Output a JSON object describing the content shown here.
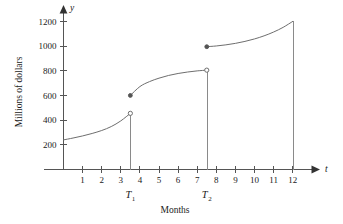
{
  "chart_data": {
    "type": "line",
    "title": "",
    "subtitle": "",
    "xlabel": "Months",
    "ylabel": "Millions of dollars",
    "x_axis_variable": "t",
    "y_axis_variable": "y",
    "xlim": [
      0,
      12.8
    ],
    "ylim": [
      0,
      1260
    ],
    "grid": false,
    "legend": "none",
    "x_ticks": [
      1,
      2,
      3,
      4,
      5,
      6,
      7,
      8,
      9,
      10,
      11,
      12
    ],
    "x_tick_labels": [
      "1",
      "2",
      "3",
      "4",
      "5",
      "6",
      "7",
      "8",
      "9",
      "10",
      "11",
      "12"
    ],
    "y_ticks": [
      200,
      400,
      600,
      800,
      1000,
      1200
    ],
    "y_tick_labels": [
      "200",
      "400",
      "600",
      "800",
      "1000",
      "1200"
    ],
    "annotations": [
      {
        "name": "T1",
        "label": "T",
        "subscript": "1",
        "x": 3.5
      },
      {
        "name": "T2",
        "label": "T",
        "subscript": "2",
        "x": 7.5
      }
    ],
    "series": [
      {
        "name": "segment-1",
        "x": [
          0.0,
          0.5,
          1.0,
          1.5,
          2.0,
          2.5,
          3.0,
          3.5
        ],
        "values": [
          240,
          255,
          272,
          292,
          316,
          348,
          394,
          455
        ],
        "start_marker": "none",
        "end_marker": "open"
      },
      {
        "name": "segment-2",
        "x": [
          3.5,
          4.0,
          4.5,
          5.0,
          5.5,
          6.0,
          6.5,
          7.0,
          7.5
        ],
        "values": [
          600,
          672,
          712,
          740,
          762,
          778,
          790,
          799,
          805
        ],
        "start_marker": "closed",
        "end_marker": "open"
      },
      {
        "name": "segment-3",
        "x": [
          7.5,
          8.0,
          8.5,
          9.0,
          9.5,
          10.0,
          10.5,
          11.0,
          11.5,
          12.0
        ],
        "values": [
          995,
          1001,
          1010,
          1022,
          1038,
          1058,
          1083,
          1114,
          1152,
          1200
        ],
        "start_marker": "closed",
        "end_marker": "none"
      }
    ],
    "drop_lines": [
      {
        "name": "drop-T1",
        "x": 3.5,
        "y_top": 455
      },
      {
        "name": "drop-T2",
        "x": 7.5,
        "y_top": 805
      },
      {
        "name": "drop-end",
        "x": 12.0,
        "y_top": 1200
      }
    ],
    "colors": {
      "background": "#ffffff",
      "axis": "#555555",
      "curve": "#6e6e6e",
      "drop_line": "#8a8a8a",
      "text": "#1a1a1a"
    }
  }
}
